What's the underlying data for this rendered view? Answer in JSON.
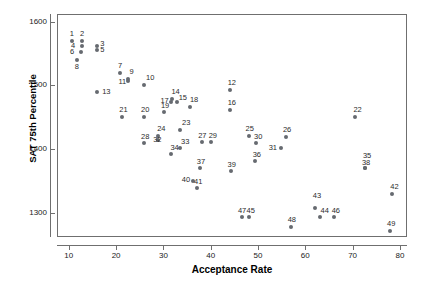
{
  "chart_data": {
    "type": "scatter",
    "title": "",
    "xlabel": "Acceptance Rate",
    "ylabel": "SAT 75th Percentile",
    "xlim": [
      7.5,
      81.5
    ],
    "ylim": [
      1262,
      1612
    ],
    "xticks": [
      10,
      20,
      30,
      40,
      50,
      60,
      70,
      80
    ],
    "yticks": [
      1300,
      1400,
      1500,
      1600
    ],
    "grid": false,
    "legend": null,
    "marker_color": "#666a70",
    "frame_color": "#6f6f6f",
    "points": [
      {
        "label": "1",
        "x": 10.6,
        "y": 1570,
        "lx": -2,
        "ly": -11
      },
      {
        "label": "2",
        "x": 12.8,
        "y": 1570,
        "lx": -2,
        "ly": -11
      },
      {
        "label": "3",
        "x": 16.0,
        "y": 1562,
        "lx": 3,
        "ly": -6
      },
      {
        "label": "4",
        "x": 12.8,
        "y": 1562,
        "lx": -11,
        "ly": -4
      },
      {
        "label": "5",
        "x": 16.0,
        "y": 1555,
        "lx": 3,
        "ly": -4
      },
      {
        "label": "6",
        "x": 12.6,
        "y": 1553,
        "lx": -11,
        "ly": -4
      },
      {
        "label": "7",
        "x": 20.8,
        "y": 1520,
        "lx": -2,
        "ly": -11
      },
      {
        "label": "8",
        "x": 11.7,
        "y": 1540,
        "lx": -2,
        "ly": 3
      },
      {
        "label": "9",
        "x": 22.6,
        "y": 1510,
        "lx": 1,
        "ly": -11
      },
      {
        "label": "10",
        "x": 25.9,
        "y": 1500,
        "lx": 2,
        "ly": -11
      },
      {
        "label": "11",
        "x": 22.6,
        "y": 1507,
        "lx": -10,
        "ly": -3
      },
      {
        "label": "12",
        "x": 44.0,
        "y": 1492,
        "lx": -2,
        "ly": -11
      },
      {
        "label": "13",
        "x": 16.0,
        "y": 1489,
        "lx": 5,
        "ly": -4
      },
      {
        "label": "14",
        "x": 31.9,
        "y": 1479,
        "lx": -1,
        "ly": -11
      },
      {
        "label": "15",
        "x": 32.8,
        "y": 1474,
        "lx": 2,
        "ly": -8
      },
      {
        "label": "16",
        "x": 44.0,
        "y": 1462,
        "lx": -2,
        "ly": -11
      },
      {
        "label": "17",
        "x": 31.7,
        "y": 1474,
        "lx": -11,
        "ly": -5
      },
      {
        "label": "18",
        "x": 35.6,
        "y": 1466,
        "lx": 0,
        "ly": -11
      },
      {
        "label": "19",
        "x": 30.1,
        "y": 1458,
        "lx": -3,
        "ly": -10
      },
      {
        "label": "20",
        "x": 25.9,
        "y": 1450,
        "lx": -3,
        "ly": -11
      },
      {
        "label": "21",
        "x": 21.3,
        "y": 1450,
        "lx": -3,
        "ly": -11
      },
      {
        "label": "22",
        "x": 70.6,
        "y": 1450,
        "lx": -2,
        "ly": -11
      },
      {
        "label": "23",
        "x": 33.5,
        "y": 1430,
        "lx": 2,
        "ly": -11
      },
      {
        "label": "24",
        "x": 28.9,
        "y": 1421,
        "lx": -1,
        "ly": -11
      },
      {
        "label": "25",
        "x": 48.0,
        "y": 1421,
        "lx": -3,
        "ly": -11
      },
      {
        "label": "26",
        "x": 55.9,
        "y": 1419,
        "lx": -3,
        "ly": -11
      },
      {
        "label": "27",
        "x": 38.2,
        "y": 1411,
        "lx": -4,
        "ly": -10
      },
      {
        "label": "28",
        "x": 25.9,
        "y": 1410,
        "lx": -3,
        "ly": -10
      },
      {
        "label": "29",
        "x": 40.0,
        "y": 1411,
        "lx": -2,
        "ly": -10
      },
      {
        "label": "30",
        "x": 49.6,
        "y": 1410,
        "lx": -2,
        "ly": -10
      },
      {
        "label": "31",
        "x": 54.8,
        "y": 1401,
        "lx": -12,
        "ly": -4
      },
      {
        "label": "32",
        "x": 28.9,
        "y": 1414,
        "lx": -5,
        "ly": -4
      },
      {
        "label": "33",
        "x": 33.5,
        "y": 1401,
        "lx": 1,
        "ly": -10
      },
      {
        "label": "34",
        "x": 31.7,
        "y": 1392,
        "lx": -1,
        "ly": -10
      },
      {
        "label": "35",
        "x": 72.6,
        "y": 1371,
        "lx": -2,
        "ly": -16
      },
      {
        "label": "36",
        "x": 49.3,
        "y": 1382,
        "lx": -2,
        "ly": -10
      },
      {
        "label": "37",
        "x": 37.7,
        "y": 1370,
        "lx": -3,
        "ly": -10
      },
      {
        "label": "38",
        "x": 72.6,
        "y": 1371,
        "lx": -3,
        "ly": -9
      },
      {
        "label": "39",
        "x": 44.2,
        "y": 1365,
        "lx": -3,
        "ly": -10
      },
      {
        "label": "40",
        "x": 36.2,
        "y": 1350,
        "lx": -11,
        "ly": -5
      },
      {
        "label": "41",
        "x": 37.1,
        "y": 1339,
        "lx": -3,
        "ly": -10
      },
      {
        "label": "42",
        "x": 78.4,
        "y": 1329,
        "lx": -2,
        "ly": -11
      },
      {
        "label": "43",
        "x": 62.0,
        "y": 1308,
        "lx": -2,
        "ly": -16
      },
      {
        "label": "44",
        "x": 63.0,
        "y": 1293,
        "lx": 1,
        "ly": -10
      },
      {
        "label": "45",
        "x": 48.0,
        "y": 1293,
        "lx": -2,
        "ly": -10
      },
      {
        "label": "46",
        "x": 66.0,
        "y": 1293,
        "lx": -2,
        "ly": -10
      },
      {
        "label": "47",
        "x": 46.6,
        "y": 1293,
        "lx": -4,
        "ly": -10
      },
      {
        "label": "48",
        "x": 56.9,
        "y": 1277,
        "lx": -3,
        "ly": -11
      },
      {
        "label": "49",
        "x": 77.9,
        "y": 1271,
        "lx": -3,
        "ly": -11
      }
    ]
  }
}
